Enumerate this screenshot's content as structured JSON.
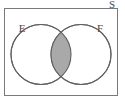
{
  "figure": {
    "type": "venn-diagram",
    "title": "",
    "universal_set_label": "S",
    "set_labels": {
      "left": "E",
      "right": "F"
    },
    "shaded_region": "intersection",
    "shaded_region_description": "E and F (E ∩ F)",
    "colors": {
      "background": "#ffffff",
      "stroke": "#6f6f6f",
      "rectangle_stroke": "#7a7a7a",
      "shading_fill": "#a9a9a9",
      "shading_stroke": "#555555",
      "circle_fill": "#ffffff",
      "label_text": "#4a4a4a"
    },
    "geometry": {
      "rectangle": {
        "x": 4,
        "y": 8,
        "width": 114,
        "height": 88
      },
      "left_circle": {
        "cx": 41,
        "cy": 54.5,
        "r": 30
      },
      "right_circle": {
        "cx": 81,
        "cy": 54.5,
        "r": 30
      }
    },
    "label_positions": {
      "universal": {
        "x": 112,
        "y": 4
      },
      "left": {
        "x": 22,
        "y": 29
      },
      "right": {
        "x": 100,
        "y": 29
      }
    }
  }
}
